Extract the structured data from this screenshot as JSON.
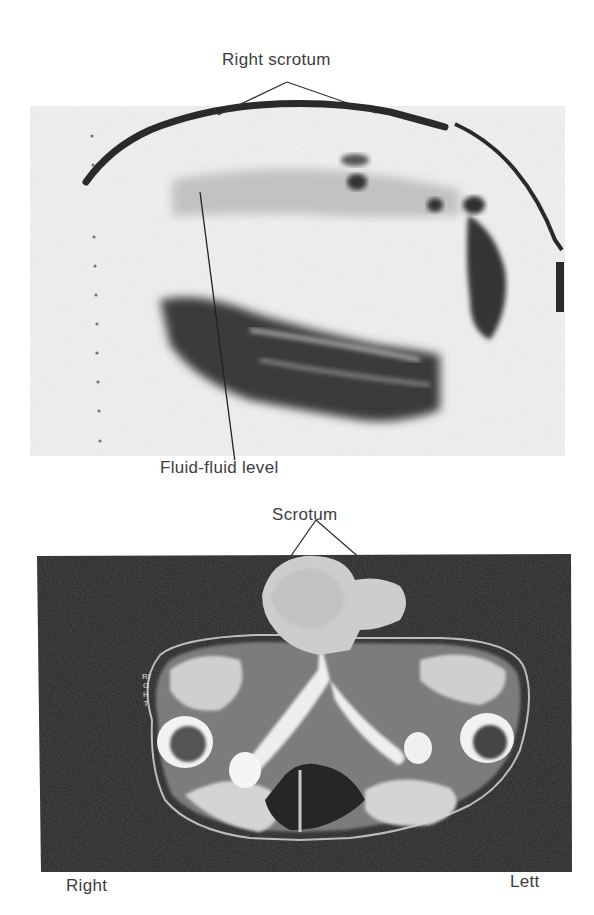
{
  "figure": {
    "top_panel": {
      "type": "ultrasound-sonogram",
      "labels": {
        "right_scrotum": "Right scrotum",
        "fluid_fluid_level": "Fluid-fluid level"
      },
      "scale_dots": 12
    },
    "bottom_panel": {
      "type": "ct-axial-scan",
      "labels": {
        "scrotum": "Scrotum",
        "right": "Right",
        "left": "Lett",
        "embedded_side_marker": "RIGHT"
      }
    },
    "colors": {
      "background": "#ffffff",
      "sonogram_bg": "#f2f2f2",
      "sonogram_dark": "#2e2e2e",
      "ct_bg": "#262626",
      "ct_tissue": "#d9d9d9",
      "text": "#3d3d3d"
    }
  }
}
